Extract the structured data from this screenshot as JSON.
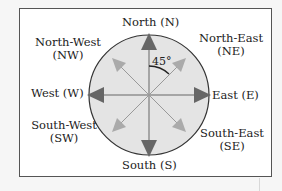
{
  "diagram": {
    "angle_label": "45°",
    "directions": {
      "north": {
        "name": "North",
        "abbr": "(N)",
        "line1": "North (N)"
      },
      "north_east": {
        "line1": "North-East",
        "line2": "(NE)"
      },
      "east": {
        "line1": "East (E)"
      },
      "south_east": {
        "line1": "South-East",
        "line2": "(SE)"
      },
      "south": {
        "line1": "South (S)"
      },
      "south_west": {
        "line1": "South-West",
        "line2": "(SW)"
      },
      "west": {
        "line1": "West (W)"
      },
      "north_west": {
        "line1": "North-West",
        "line2": "(NW)"
      }
    },
    "colors": {
      "circle_fill": "#e4e4e4",
      "circle_stroke": "#333333",
      "cardinal_arrow": "#666666",
      "intercardinal_arrow": "#aaaaaa",
      "frame_border": "#555555"
    }
  }
}
